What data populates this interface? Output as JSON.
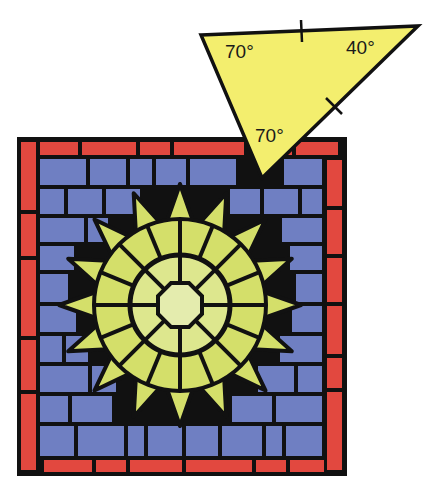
{
  "figure": {
    "colors": {
      "background": "#ffffff",
      "lead": "#111111",
      "border_tile": "#e2483f",
      "sky_tile": "#6f7fc2",
      "sun_tile": "#d4df6a",
      "sun_center": "#e4ecae",
      "triangle_fill": "#f3ee6e"
    },
    "triangle": {
      "name": "isosceles triangle tile",
      "angles": [
        {
          "vertex": "top-left",
          "label": "70°"
        },
        {
          "vertex": "top-right",
          "label": "40°"
        },
        {
          "vertex": "bottom",
          "label": "70°"
        }
      ],
      "congruent_side_marks": [
        "top side",
        "right side"
      ]
    },
    "mosaic": {
      "shape": "square",
      "motif": "16-point sun",
      "border": "red brick tiles",
      "fill": "blue brick tiles"
    }
  }
}
